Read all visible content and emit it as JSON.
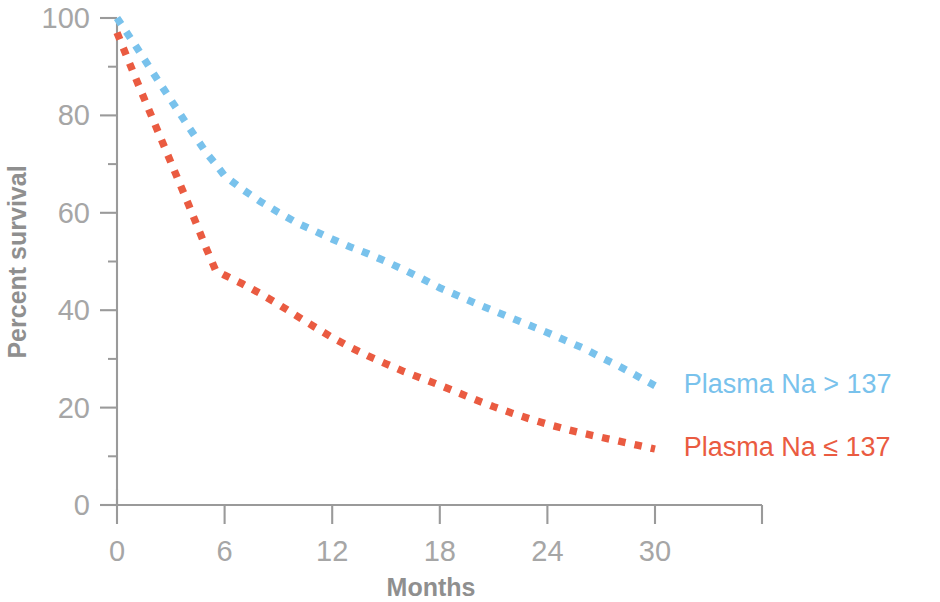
{
  "chart_data": {
    "type": "line",
    "title": "",
    "subtitle": "",
    "xlabel": "Months",
    "ylabel": "Percent survival",
    "xlim": [
      0,
      36
    ],
    "ylim": [
      0,
      100
    ],
    "grid": false,
    "legend_position": "right-inline",
    "x_ticks": [
      0,
      6,
      12,
      18,
      24,
      30
    ],
    "x_tick_labels": [
      "0",
      "6",
      "12",
      "18",
      "24",
      "30"
    ],
    "x_minor_ticks": [],
    "y_ticks": [
      0,
      20,
      40,
      60,
      80,
      100
    ],
    "y_tick_labels": [
      "0",
      "20",
      "40",
      "60",
      "80",
      "100"
    ],
    "y_minor_ticks": [
      10,
      30,
      50,
      70,
      90
    ],
    "line_style": "dotted",
    "series": [
      {
        "name": "Plasma Na > 137",
        "color": "#79c2ec",
        "x": [
          0,
          1,
          2,
          3,
          4,
          5,
          5.5,
          6,
          7,
          8,
          9,
          10,
          11,
          12,
          13,
          14,
          15,
          16,
          17,
          18,
          19,
          20,
          21,
          22,
          23,
          24,
          25,
          26,
          27,
          28,
          29,
          30
        ],
        "values": [
          100,
          94.5,
          88.8,
          83.2,
          77.6,
          72.2,
          70.0,
          67.6,
          64.8,
          62.3,
          60.1,
          58.0,
          56.3,
          54.6,
          53.0,
          51.6,
          50.0,
          48.3,
          46.5,
          44.6,
          43.0,
          41.4,
          39.9,
          38.4,
          36.9,
          35.4,
          33.8,
          32.2,
          30.3,
          28.5,
          26.5,
          24.5
        ]
      },
      {
        "name": "Plasma Na ≤ 137",
        "color": "#ea5b41",
        "x": [
          0,
          1,
          2,
          3,
          4,
          5,
          5.5,
          6,
          7,
          8,
          9,
          10,
          11,
          12,
          13,
          14,
          15,
          16,
          17,
          18,
          19,
          20,
          21,
          22,
          23,
          24,
          25,
          26,
          27,
          28,
          29,
          30
        ],
        "values": [
          97.0,
          88.0,
          79.2,
          70.4,
          61.6,
          52.5,
          48.2,
          47.2,
          45.4,
          43.4,
          41.2,
          38.9,
          36.6,
          34.4,
          32.4,
          30.6,
          29.0,
          27.4,
          26.0,
          24.6,
          23.1,
          21.6,
          20.2,
          18.9,
          17.7,
          16.6,
          15.6,
          14.7,
          13.9,
          13.1,
          12.3,
          11.5
        ]
      }
    ],
    "annotations": [
      {
        "text": "Plasma Na > 137",
        "x": 31.6,
        "y": 24.5,
        "color": "#79c2ec"
      },
      {
        "text": "Plasma Na ≤ 137",
        "x": 31.6,
        "y": 11.5,
        "color": "#ea5b41"
      }
    ]
  },
  "colors": {
    "background": "#ffffff",
    "axis": "#9a9a9a",
    "tick_label": "#a6a6a6",
    "axis_title": "#8f8f8f",
    "series_blue": "#79c2ec",
    "series_red": "#ea5b41"
  }
}
